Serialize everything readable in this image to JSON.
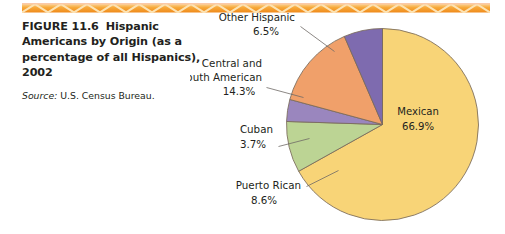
{
  "figure": {
    "label": "FIGURE 11.6",
    "title": "Hispanic Americans by Origin (as a percentage of all Hispanics), 2002",
    "source_key": "Source:",
    "source_value": "U.S. Census Bureau."
  },
  "colors": {
    "rule": "#F6A023",
    "rule_light": "#FBD27E",
    "mexican": "#F8D477",
    "puerto_rican": "#BCD494",
    "cuban": "#9A86BE",
    "central_south_american": "#F0A06A",
    "other_hispanic": "#7E6BAF",
    "slice_outline": "#7A6A5A",
    "leader": "#6F6A66",
    "text": "#231F20"
  },
  "chart_data": {
    "type": "pie",
    "title": "Hispanic Americans by Origin (as a percentage of all Hispanics), 2002",
    "xlabel": "",
    "ylabel": "",
    "units": "percent",
    "legend": "none",
    "start_angle_deg": 0,
    "direction": "clockwise",
    "categories": [
      "Mexican",
      "Puerto Rican",
      "Cuban",
      "Central and South American",
      "Other Hispanic"
    ],
    "values": [
      66.9,
      8.6,
      3.7,
      14.3,
      6.5
    ],
    "slices": [
      {
        "name": "Mexican",
        "label": "Mexican",
        "value": 66.9,
        "value_label": "66.9%",
        "color": "#F8D477",
        "label_placement": "inside"
      },
      {
        "name": "Puerto Rican",
        "label": "Puerto Rican",
        "value": 8.6,
        "value_label": "8.6%",
        "color": "#BCD494",
        "label_placement": "outside-leader"
      },
      {
        "name": "Cuban",
        "label": "Cuban",
        "value": 3.7,
        "value_label": "3.7%",
        "color": "#9A86BE",
        "label_placement": "outside-leader"
      },
      {
        "name": "Central and South American",
        "label_line1": "Central and",
        "label_line2": "South American",
        "value": 14.3,
        "value_label": "14.3%",
        "color": "#F0A06A",
        "label_placement": "outside-leader"
      },
      {
        "name": "Other Hispanic",
        "label": "Other Hispanic",
        "value": 6.5,
        "value_label": "6.5%",
        "color": "#7E6BAF",
        "label_placement": "outside-leader"
      }
    ]
  }
}
